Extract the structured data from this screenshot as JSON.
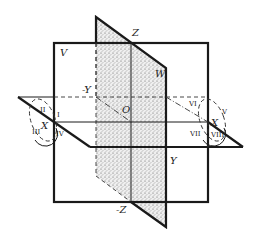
{
  "diagram": {
    "planes": {
      "V": "V",
      "W": "W"
    },
    "axes": {
      "z_pos": "Z",
      "z_neg": "-Z",
      "y_pos": "Y",
      "y_neg": "-Y",
      "x_left": "X",
      "x_right": "X",
      "origin": "O"
    },
    "octants_left": [
      "I",
      "II",
      "III",
      "IV"
    ],
    "octants_right": [
      "V",
      "VI",
      "VII",
      "VIII"
    ],
    "colors": {
      "line": "#1a1a1a",
      "shading": "#d8d8d8",
      "background": "#ffffff"
    }
  }
}
